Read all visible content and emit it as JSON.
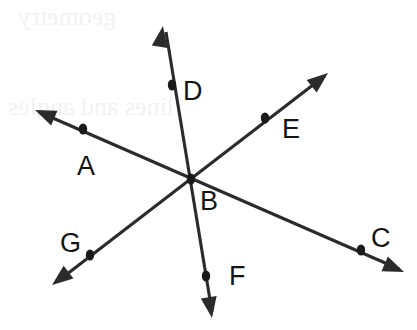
{
  "figure": {
    "canvas": {
      "width": 417,
      "height": 330
    },
    "stroke_color": "#2b2b2b",
    "dot_color": "#1a1a1a",
    "label_color": "#141414",
    "background_color": "#ffffff",
    "intersection": {
      "label": "B",
      "x": 191,
      "y": 179,
      "label_x": 200,
      "label_y": 210
    },
    "points": [
      {
        "label": "A",
        "x": 83,
        "y": 129,
        "label_x": 77,
        "label_y": 175
      },
      {
        "label": "C",
        "x": 361,
        "y": 250,
        "label_x": 371,
        "label_y": 247
      },
      {
        "label": "D",
        "x": 172,
        "y": 85,
        "label_x": 183,
        "label_y": 100
      },
      {
        "label": "E",
        "x": 265,
        "y": 118,
        "label_x": 282,
        "label_y": 138
      },
      {
        "label": "F",
        "x": 206,
        "y": 276,
        "label_x": 229,
        "label_y": 285
      },
      {
        "label": "G",
        "x": 90,
        "y": 255,
        "label_x": 60,
        "label_y": 252
      }
    ],
    "lines": [
      {
        "name": "line-a-c",
        "through": [
          "A",
          "B",
          "C"
        ],
        "from": {
          "x": 39,
          "y": 112
        },
        "to": {
          "x": 399,
          "y": 269
        },
        "arrow_start": {
          "tip_x": 35,
          "tip_y": 110,
          "angle_deg": 203
        },
        "arrow_end": {
          "tip_x": 404,
          "tip_y": 272,
          "angle_deg": 23
        }
      },
      {
        "name": "line-d-f",
        "through": [
          "D",
          "B",
          "F"
        ],
        "from": {
          "x": 166,
          "y": 32
        },
        "to": {
          "x": 212,
          "y": 312
        },
        "arrow_start": {
          "tip_x": 163,
          "tip_y": 26,
          "angle_deg": 279
        },
        "arrow_end": {
          "tip_x": 212,
          "tip_y": 318,
          "angle_deg": 81
        }
      },
      {
        "name": "line-e-g",
        "through": [
          "E",
          "B",
          "G"
        ],
        "from": {
          "x": 322,
          "y": 78
        },
        "to": {
          "x": 58,
          "y": 281
        },
        "arrow_start": {
          "tip_x": 328,
          "tip_y": 73,
          "angle_deg": 321
        },
        "arrow_end": {
          "tip_x": 52,
          "tip_y": 285,
          "angle_deg": 142
        }
      }
    ],
    "watermark": {
      "visible": true,
      "line1": "geometry",
      "line2": "lines and angles"
    }
  }
}
